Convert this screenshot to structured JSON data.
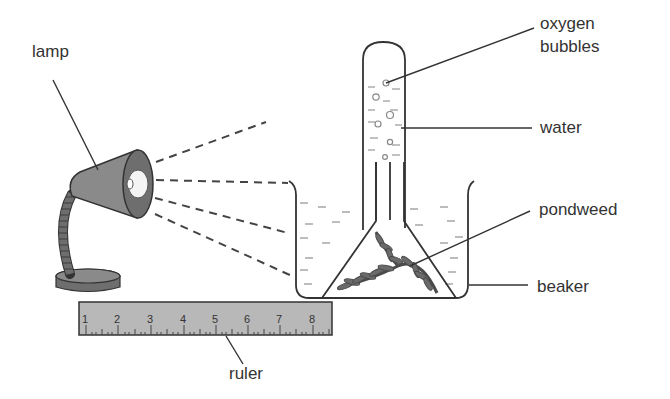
{
  "diagram": {
    "labels": {
      "lamp": "lamp",
      "oxygen_bubbles_line1": "oxygen",
      "oxygen_bubbles_line2": "bubbles",
      "water": "water",
      "pondweed": "pondweed",
      "beaker": "beaker",
      "ruler": "ruler"
    },
    "ruler": {
      "ticks": [
        "1",
        "2",
        "3",
        "4",
        "5",
        "6",
        "7",
        "8"
      ]
    },
    "colors": {
      "line": "#333333",
      "lamp_fill": "#8a8a8a",
      "lamp_dark": "#6e6e6e",
      "ruler_fill": "#b8b8b8",
      "water_dash": "#9a9a9a",
      "pondweed": "#5a5a5a"
    }
  }
}
